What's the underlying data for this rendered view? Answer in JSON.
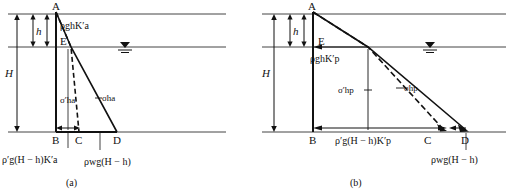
{
  "figure": {
    "title_visible": false,
    "panels": [
      {
        "id": "a",
        "caption": "(a)",
        "type": "active-earth-pressure-diagram",
        "points": {
          "A": "A",
          "B": "B",
          "C": "C",
          "D": "D",
          "E": "E"
        },
        "dimension_labels": {
          "h": "h",
          "H": "H"
        },
        "pressure_labels": {
          "top_wedge": "ρghK′a",
          "effective_stress": "σ′ha",
          "total_stress": "σha",
          "bottom_left": "ρ′g(H − h)K′a",
          "bottom_right": "ρwg(H − h)"
        },
        "water_table_symbol": "▽"
      },
      {
        "id": "b",
        "caption": "(b)",
        "type": "passive-earth-pressure-diagram",
        "points": {
          "A": "A",
          "B": "B",
          "C": "C",
          "D": "D",
          "E": "E"
        },
        "dimension_labels": {
          "h": "h",
          "H": "H"
        },
        "pressure_labels": {
          "top_wedge": "ρghK′p",
          "effective_stress": "σ′hp",
          "total_stress": "σhp",
          "bottom_left": "ρ′g(H − h)K′p",
          "bottom_right": "ρwg(H − h)"
        },
        "water_table_symbol": "▽"
      }
    ],
    "colors": {
      "line": "#111111",
      "thin_line": "#555555",
      "background": "#ffffff"
    }
  }
}
